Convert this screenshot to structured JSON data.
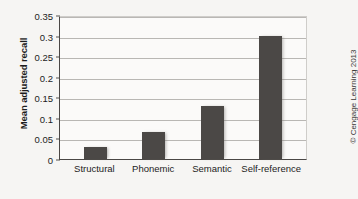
{
  "chart_data": {
    "type": "bar",
    "title": "",
    "xlabel": "",
    "ylabel": "Mean adjusted recall",
    "categories": [
      "Structural",
      "Phonemic",
      "Semantic",
      "Self-reference"
    ],
    "values": [
      0.03,
      0.065,
      0.13,
      0.3
    ],
    "ylim": [
      0,
      0.35
    ],
    "ytick_labels": [
      "0",
      "0.05",
      "0.1",
      "0.15",
      "0.2",
      "0.25",
      "0.3",
      "0.35"
    ],
    "ytick_values": [
      0,
      0.05,
      0.1,
      0.15,
      0.2,
      0.25,
      0.3,
      0.35
    ],
    "grid": "horizontal",
    "legend": "none",
    "bar_color": "#4b4846",
    "gridline_color": "#b9b7b4",
    "axis_color": "#4a4745",
    "background_color": "#f6f5f3"
  },
  "credit": {
    "text": "© Cengage Learning 2013"
  }
}
